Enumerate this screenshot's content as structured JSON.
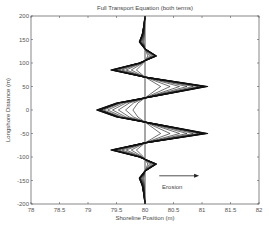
{
  "chart_data": {
    "type": "line",
    "title": "Full Transport Equation (both terms)",
    "xlabel": "Shoreline Position (m)",
    "ylabel": "Longshore Distance (m)",
    "xlim": [
      78,
      82
    ],
    "ylim": [
      -200,
      200
    ],
    "xticks": [
      "78",
      "78.5",
      "79",
      "79.5",
      "80",
      "80.5",
      "81",
      "81.5",
      "82"
    ],
    "yticks": [
      "200",
      "150",
      "100",
      "50",
      "0",
      "-50",
      "-100",
      "-150",
      "-200"
    ],
    "grid": false,
    "reference_line": {
      "x": 80
    },
    "annotation": {
      "text": "Erosion",
      "arrow": "right",
      "arrow_from": [
        80.25,
        -140
      ],
      "arrow_to": [
        80.95,
        -140
      ]
    },
    "profile": {
      "y": [
        200,
        180,
        160,
        145,
        130,
        115,
        100,
        85,
        70,
        50,
        30,
        15,
        0,
        -15,
        -30,
        -50,
        -70,
        -85,
        -100,
        -115,
        -130,
        -145,
        -160,
        -180,
        -200
      ],
      "x_final": [
        80.0,
        79.98,
        79.95,
        79.9,
        80.0,
        80.2,
        79.9,
        79.4,
        80.0,
        81.1,
        80.2,
        79.5,
        79.15,
        79.5,
        80.2,
        81.1,
        80.0,
        79.4,
        79.9,
        80.2,
        80.0,
        79.9,
        79.95,
        79.98,
        80.0
      ]
    },
    "series": [
      {
        "name": "t1",
        "amplitude_scale": 0.25
      },
      {
        "name": "t2",
        "amplitude_scale": 0.4
      },
      {
        "name": "t3",
        "amplitude_scale": 0.55
      },
      {
        "name": "t4",
        "amplitude_scale": 0.67
      },
      {
        "name": "t5",
        "amplitude_scale": 0.77
      },
      {
        "name": "t6",
        "amplitude_scale": 0.85
      },
      {
        "name": "t7",
        "amplitude_scale": 0.91
      },
      {
        "name": "t8",
        "amplitude_scale": 0.95
      },
      {
        "name": "t9",
        "amplitude_scale": 0.98
      },
      {
        "name": "t10",
        "amplitude_scale": 1.0
      }
    ]
  }
}
